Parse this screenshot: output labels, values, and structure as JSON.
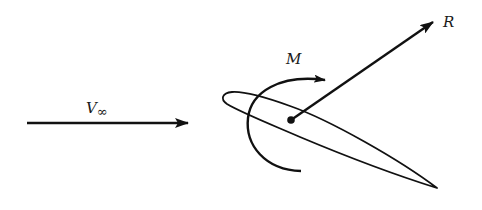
{
  "diagram": {
    "labels": {
      "freestream": "V",
      "freestream_sub": "∞",
      "moment": "M",
      "resultant": "R"
    },
    "colors": {
      "stroke": "#111111",
      "background": "#ffffff"
    },
    "elements": [
      {
        "id": "freestream-arrow",
        "from": [
          27,
          123
        ],
        "to": [
          188,
          123
        ]
      },
      {
        "id": "airfoil",
        "leading_edge": [
          224,
          96
        ],
        "trailing_edge": [
          437,
          188
        ]
      },
      {
        "id": "reference-point",
        "at": [
          291,
          120
        ]
      },
      {
        "id": "resultant-arrow",
        "from": [
          291,
          120
        ],
        "to": [
          433,
          22
        ]
      },
      {
        "id": "moment-arc",
        "direction": "clockwise"
      }
    ]
  }
}
